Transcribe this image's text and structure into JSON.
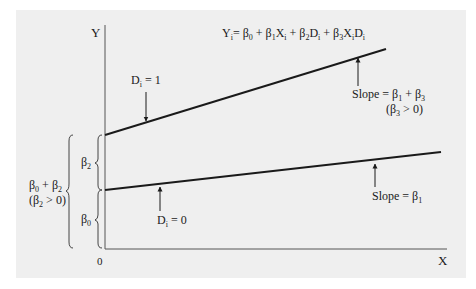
{
  "diagram": {
    "equation": {
      "y": "Y",
      "i": "i",
      "parts": [
        "= β",
        "0",
        " + β",
        "1",
        "X",
        "i",
        " + β",
        "2",
        "D",
        "i",
        " + β",
        "3",
        "X",
        "i",
        "D",
        "i"
      ]
    },
    "axes": {
      "y_label": "Y",
      "x_label": "X",
      "origin_label": "0"
    },
    "lines": [
      {
        "name": "Di = 1",
        "label_main": "D",
        "label_sub": "i",
        "label_eq": " = 1",
        "slope_label": "Slope = β",
        "slope_sub1": "1",
        "slope_plus": " + β",
        "slope_sub2": "3",
        "condition_open": "(β",
        "condition_sub": "3",
        "condition_close": " > 0)",
        "start": [
          105,
          135
        ],
        "end": [
          386,
          49
        ]
      },
      {
        "name": "Di = 0",
        "label_main": "D",
        "label_sub": "i",
        "label_eq": " = 0",
        "slope_label": "Slope = β",
        "slope_sub1": "1",
        "start": [
          105,
          190
        ],
        "end": [
          441,
          152
        ]
      }
    ],
    "braces": {
      "beta2": {
        "label": "β",
        "sub": "2"
      },
      "beta0": {
        "label": "β",
        "sub": "0"
      },
      "combined": {
        "line1_a": "β",
        "line1_sub_a": "0",
        "line1_b": " + β",
        "line1_sub_b": "2",
        "line2_a": "(β",
        "line2_sub": "2",
        "line2_b": " > 0)"
      }
    },
    "colors": {
      "panel": "#efefef",
      "ink": "#1a1a1a",
      "axis": "#555555"
    }
  }
}
